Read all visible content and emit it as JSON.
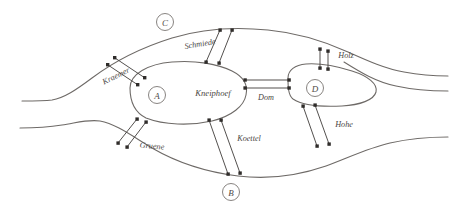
{
  "figure": {
    "background_color": "#ffffff",
    "ink_color": "#6e6a67",
    "label_color": "#4a4643"
  },
  "landmasses": [
    {
      "id": "A",
      "name": "A",
      "kind": "island-node",
      "cx": 157,
      "cy": 95,
      "r": 8.5
    },
    {
      "id": "B",
      "name": "B",
      "kind": "south-bank-node",
      "cx": 231,
      "cy": 192,
      "r": 8.5
    },
    {
      "id": "C",
      "name": "C",
      "kind": "north-bank-node",
      "cx": 165,
      "cy": 22,
      "r": 8.5
    },
    {
      "id": "D",
      "name": "D",
      "kind": "east-island-node",
      "cx": 315,
      "cy": 88,
      "r": 8.5
    }
  ],
  "island_labels": [
    {
      "id": "kneiphoef",
      "text": "Kneiphoef",
      "x": 213,
      "cy": 93
    }
  ],
  "bridges": [
    {
      "id": "kraemer",
      "label": "Kraemer",
      "label_x": 116,
      "label_y": 76,
      "rotate": -26,
      "connects": [
        "C",
        "A"
      ]
    },
    {
      "id": "schmiede",
      "label": "Schmiede",
      "label_x": 200,
      "label_y": 44,
      "rotate": 0,
      "connects": [
        "C",
        "A"
      ]
    },
    {
      "id": "holz",
      "label": "Holz",
      "label_x": 346,
      "label_y": 55,
      "rotate": 0,
      "connects": [
        "C",
        "D"
      ]
    },
    {
      "id": "dom",
      "label": "Dom",
      "label_x": 266,
      "label_y": 97,
      "rotate": 0,
      "connects": [
        "A",
        "D"
      ]
    },
    {
      "id": "gruene",
      "label": "Gruene",
      "label_x": 152,
      "label_y": 146,
      "rotate": 0,
      "connects": [
        "A",
        "B"
      ]
    },
    {
      "id": "koettel",
      "label": "Koettel",
      "label_x": 249,
      "label_y": 138,
      "rotate": 0,
      "connects": [
        "A",
        "B"
      ]
    },
    {
      "id": "hohe",
      "label": "Hohe",
      "label_x": 344,
      "label_y": 124,
      "rotate": 0,
      "connects": [
        "D",
        "B"
      ]
    }
  ]
}
